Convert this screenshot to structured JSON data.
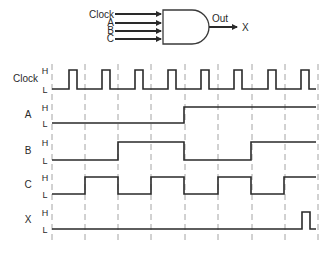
{
  "gate": {
    "type": "AND",
    "inputs": [
      "Clock",
      "A",
      "B",
      "C"
    ],
    "output_label": "Out",
    "output_target": "X"
  },
  "timing": {
    "level_high": "H",
    "level_low": "L",
    "grid_x": [
      52,
      85,
      118,
      151,
      185,
      218,
      252,
      285,
      318
    ],
    "signals": [
      {
        "name": "Clock",
        "label": "Clock",
        "high_y": 70,
        "low_y": 89,
        "label_y": 82,
        "segments": "M52,89 H69 V70 H77 V89 H102 V70 H110 V89 H135 V70 H143 V89 H168 V70 H176 V89 H201 V70 H209 V89 H234 V70 H242 V89 H268 V70 H276 V89 H301 V70 H309 V89 H316"
      },
      {
        "name": "A",
        "label": "A",
        "high_y": 107,
        "low_y": 123,
        "label_y": 118,
        "segments": "M52,123 H184 V107 H316"
      },
      {
        "name": "B",
        "label": "B",
        "high_y": 142,
        "low_y": 160,
        "label_y": 154,
        "segments": "M52,160 H118 V142 H184 V160 H251 V142 H316"
      },
      {
        "name": "C",
        "label": "C",
        "high_y": 177,
        "low_y": 194,
        "label_y": 188,
        "segments": "M52,194 H85 V177 H118 V194 H151 V177 H184 V194 H218 V177 H251 V194 H284 V177 H316"
      },
      {
        "name": "X",
        "label": "X",
        "high_y": 212,
        "low_y": 229,
        "label_y": 223,
        "segments": "M52,229 H302 V212 H310 V229 H316"
      }
    ]
  }
}
